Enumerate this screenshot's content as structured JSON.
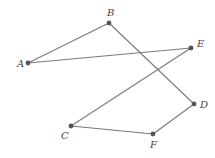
{
  "diagram": {
    "type": "graph",
    "vertices": [
      {
        "id": "A",
        "label": "A",
        "x": 28,
        "y": 63,
        "lx": 17,
        "ly": 67
      },
      {
        "id": "B",
        "label": "B",
        "x": 109,
        "y": 23,
        "lx": 107,
        "ly": 16
      },
      {
        "id": "E",
        "label": "E",
        "x": 191,
        "y": 48,
        "lx": 197,
        "ly": 47
      },
      {
        "id": "D",
        "label": "D",
        "x": 194,
        "y": 104,
        "lx": 200,
        "ly": 108
      },
      {
        "id": "C",
        "label": "C",
        "x": 71,
        "y": 126,
        "lx": 61,
        "ly": 139
      },
      {
        "id": "F",
        "label": "F",
        "x": 153,
        "y": 134,
        "lx": 150,
        "ly": 148
      }
    ],
    "edges": [
      {
        "from": "A",
        "to": "B"
      },
      {
        "from": "A",
        "to": "E"
      },
      {
        "from": "B",
        "to": "D"
      },
      {
        "from": "E",
        "to": "C"
      },
      {
        "from": "C",
        "to": "F"
      },
      {
        "from": "F",
        "to": "D"
      }
    ],
    "colors": {
      "edge": "#7a7a7a",
      "vertex": "#555555",
      "label": "#444444"
    }
  }
}
